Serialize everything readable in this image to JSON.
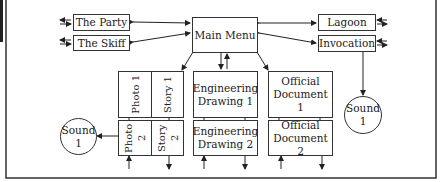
{
  "diagram": {
    "nodes": {
      "the_party": "The Party",
      "the_skiff": "The Skiff",
      "main_menu": "Main Menu",
      "lagoon": "Lagoon",
      "invocation": "Invocation",
      "sound_right": "Sound 1",
      "sound_left": "Sound 1",
      "photo1": "Photo 1",
      "story1": "Story 1",
      "photo2": "Photo 2",
      "story2": "Story 2",
      "eng1": "Engineering Drawing 1",
      "eng2": "Engineering Drawing 2",
      "doc1": "Official Document 1",
      "doc2": "Official Document 2"
    },
    "labels": {
      "sound_word": "Sound",
      "sound_num": "1",
      "eng_word": "Engineering",
      "drawing1": "Drawing 1",
      "drawing2": "Drawing 2",
      "official_word": "Official",
      "document1": "Document 1",
      "document2": "Document 2"
    },
    "edges": [
      {
        "from": "the_party",
        "to": "main_menu",
        "type": "bidirectional"
      },
      {
        "from": "the_skiff",
        "to": "main_menu",
        "type": "bidirectional"
      },
      {
        "from": "lagoon",
        "to": "main_menu",
        "type": "bidirectional"
      },
      {
        "from": "invocation",
        "to": "main_menu",
        "type": "bidirectional"
      },
      {
        "from": "invocation",
        "to": "sound_right",
        "type": "directed"
      },
      {
        "from": "main_menu",
        "to": "photo1_story1",
        "type": "bidirectional"
      },
      {
        "from": "main_menu",
        "to": "eng1",
        "type": "bidirectional"
      },
      {
        "from": "main_menu",
        "to": "doc1",
        "type": "bidirectional"
      },
      {
        "from": "photo2",
        "to": "sound_left",
        "type": "directed"
      }
    ]
  }
}
